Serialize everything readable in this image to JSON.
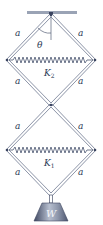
{
  "diagram": {
    "labels": {
      "side": "a",
      "angle": "θ",
      "spring_top": "K",
      "spring_top_sub": "2",
      "spring_bottom": "K",
      "spring_bottom_sub": "1",
      "weight": "W"
    },
    "colors": {
      "rod": "#6f7890",
      "spring": "#4a5570",
      "ceiling": "#9aa3b5",
      "weight_dark": "#4d5670",
      "weight_light": "#aab2c4",
      "text": "#2a3a55"
    }
  }
}
